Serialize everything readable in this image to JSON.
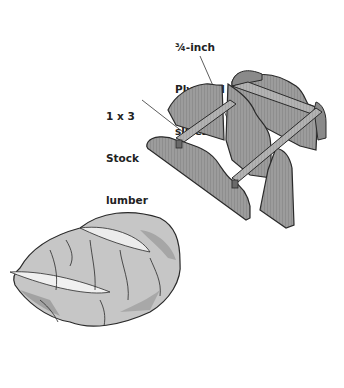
{
  "diagram": {
    "callouts": [
      {
        "id": "plywood",
        "lines": [
          "¾-inch",
          "Plywood",
          "slices"
        ],
        "points_to": "plywood-slice-panel"
      },
      {
        "id": "stock",
        "lines": [
          "1 x 3",
          "Stock",
          "lumber"
        ],
        "points_to": "stock-lumber-rail"
      }
    ],
    "parts": [
      {
        "name": "plywood-slice-panel",
        "count": 4
      },
      {
        "name": "stock-lumber-rail",
        "count": 2
      },
      {
        "name": "cabbage",
        "count": 1
      }
    ]
  },
  "colors": {
    "plywood": "#9a9a9a",
    "plywood_dark": "#7a7a7a",
    "rail": "#b4b4b4",
    "outline": "#2a2a2a",
    "cabbage_light": "#e6e6e6",
    "cabbage_mid": "#c4c4c4",
    "cabbage_dark": "#9c9c9c",
    "text": "#222222",
    "background": "#ffffff"
  }
}
